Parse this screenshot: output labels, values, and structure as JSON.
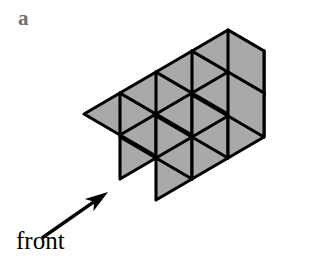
{
  "figure": {
    "panel_label": "a",
    "front_label": "front",
    "type": "isometric-block-assembly",
    "colors": {
      "background": "#ffffff",
      "cube_fill": "#a9a9a9",
      "cube_stroke": "#000000",
      "panel_label_color": "#6f6f6f",
      "front_label_color": "#000000",
      "arrow_color": "#000000"
    },
    "iso": {
      "origin_x": 84,
      "origin_y": 158,
      "unit_right_x": 36,
      "unit_right_y": -21,
      "unit_front_x": 36,
      "unit_front_y": 21,
      "unit_up": 44
    },
    "cubes": [
      {
        "id": "c1",
        "x": 0,
        "y": 1,
        "z": 0,
        "note": "front-left bottom cube, target of arrow"
      },
      {
        "id": "c2",
        "x": 1,
        "y": 1,
        "z": 0,
        "note": "front bottom cube adjacent right"
      },
      {
        "id": "c3",
        "x": 0,
        "y": 0,
        "z": 0,
        "note": "back-row leftmost cube"
      },
      {
        "id": "c4",
        "x": 1,
        "y": 0,
        "z": 0,
        "note": "back-row second cube"
      },
      {
        "id": "c5",
        "x": 2,
        "y": 0,
        "z": 0,
        "note": "back-row third cube"
      },
      {
        "id": "c6",
        "x": 3,
        "y": 0,
        "z": 0,
        "note": "back-row rightmost cube"
      },
      {
        "id": "c7",
        "x": 2,
        "y": 1,
        "z": 0,
        "note": "front protruding cube at column 3"
      }
    ],
    "cube_count": 7,
    "arrow": {
      "tail_x": 42,
      "tail_y": 238,
      "tip_x": 108,
      "tip_y": 192,
      "points_to": "front-left bottom cube face"
    }
  }
}
